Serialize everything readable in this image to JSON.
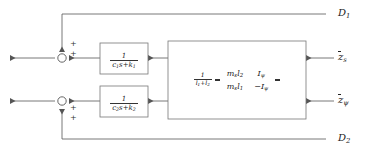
{
  "diagram": {
    "colors": {
      "line": "#555555",
      "text": "#222222",
      "block_border": "#777777",
      "background": "#ffffff"
    },
    "disturbances": [
      {
        "id": "D1",
        "label": "D",
        "subscript": "1"
      },
      {
        "id": "D2",
        "label": "D",
        "subscript": "2"
      }
    ],
    "outputs": [
      {
        "id": "z_s",
        "label": "z",
        "subscript": "s",
        "overbar": true
      },
      {
        "id": "z_psi",
        "label": "z",
        "subscript": "ψ",
        "overbar": true
      }
    ],
    "transfer_blocks": [
      {
        "id": "tf1",
        "numerator": "1",
        "denominator_c": "c",
        "denominator_c_sub": "1",
        "denominator_mid": "s+",
        "denominator_k": "k",
        "denominator_k_sub": "1"
      },
      {
        "id": "tf2",
        "numerator": "1",
        "denominator_c": "c",
        "denominator_c_sub": "2",
        "denominator_mid": "s+",
        "denominator_k": "k",
        "denominator_k_sub": "2"
      }
    ],
    "matrix_block": {
      "scalar_numerator": "1",
      "scalar_den_l1": "l",
      "scalar_den_l1_sub": "1",
      "scalar_den_plus": "+",
      "scalar_den_l2": "l",
      "scalar_den_l2_sub": "2",
      "entries": [
        {
          "row": 0,
          "col": 0,
          "base": "m",
          "base_sub": "s",
          "second": "l",
          "second_sub": "2",
          "sign": ""
        },
        {
          "row": 0,
          "col": 1,
          "base": "I",
          "base_sub": "ψ",
          "second": "",
          "second_sub": "",
          "sign": ""
        },
        {
          "row": 1,
          "col": 0,
          "base": "m",
          "base_sub": "s",
          "second": "l",
          "second_sub": "1",
          "sign": ""
        },
        {
          "row": 1,
          "col": 1,
          "base": "I",
          "base_sub": "ψ",
          "second": "",
          "second_sub": "",
          "sign": "−"
        }
      ]
    },
    "summing_junctions": [
      {
        "id": "sum1",
        "signs": [
          "+",
          "+"
        ]
      },
      {
        "id": "sum2",
        "signs": [
          "+",
          "+"
        ]
      }
    ]
  }
}
